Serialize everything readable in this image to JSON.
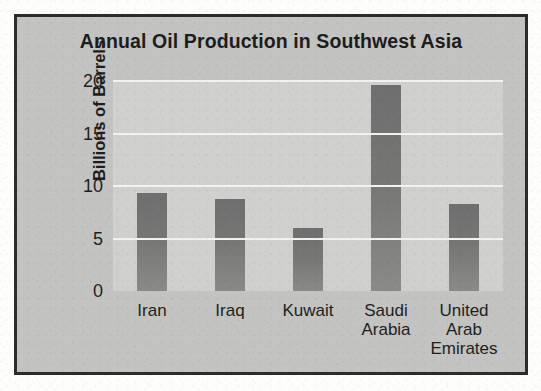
{
  "chart_data": {
    "type": "bar",
    "title": "Annual Oil Production in Southwest Asia",
    "xlabel": "Country",
    "ylabel": "Billions of Barrels",
    "categories": [
      "Iran",
      "Iraq",
      "Kuwait",
      "Saudi Arabia",
      "United Arab Emirates"
    ],
    "category_lines": [
      [
        "Iran"
      ],
      [
        "Iraq"
      ],
      [
        "Kuwait"
      ],
      [
        "Saudi",
        "Arabia"
      ],
      [
        "United",
        "Arab",
        "Emirates"
      ]
    ],
    "values": [
      9.3,
      8.8,
      6.0,
      19.6,
      8.3
    ],
    "ylim": [
      0,
      20
    ],
    "yticks": [
      20,
      15,
      10,
      5,
      0
    ],
    "grid": true,
    "legend": "none",
    "colors": {
      "bar": "#767675",
      "plot_background": "#d0d0ce",
      "frame_background": "#c3c3c1",
      "gridline": "#f2f2f0",
      "border": "#2c2c2c",
      "text": "#1d1d1d"
    }
  }
}
